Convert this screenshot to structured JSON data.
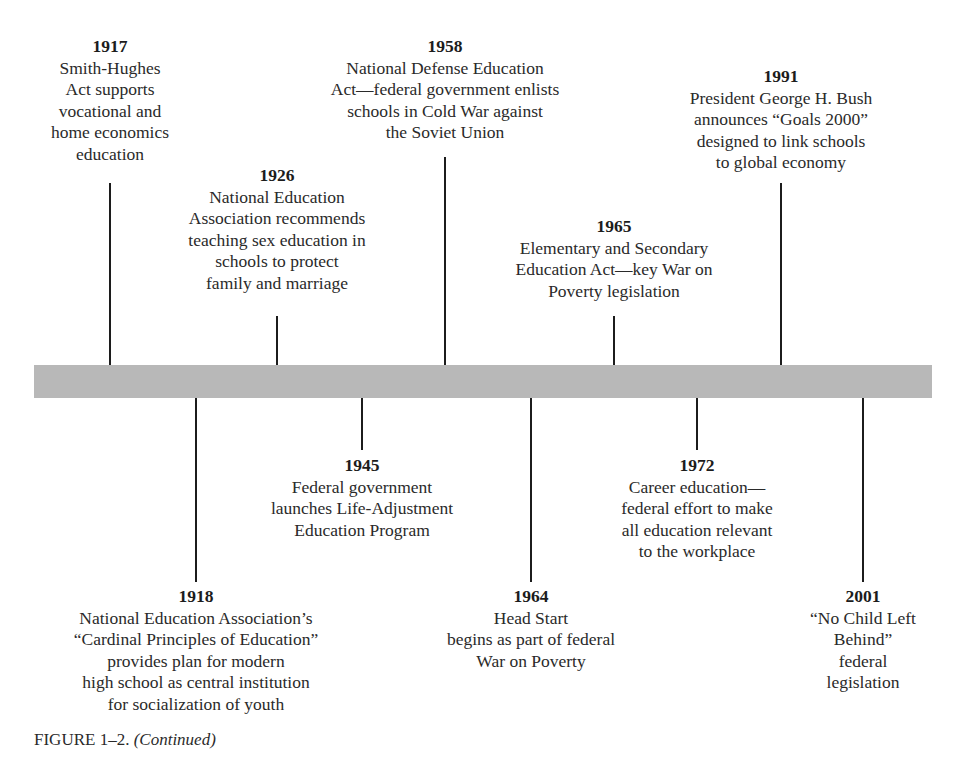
{
  "timeline": {
    "above": [
      {
        "year": "1917",
        "lines": [
          "Smith-Hughes",
          "Act supports",
          "vocational and",
          "home economics",
          "education"
        ]
      },
      {
        "year": "1926",
        "lines": [
          "National Education",
          "Association recommends",
          "teaching sex education in",
          "schools to protect",
          "family and marriage"
        ]
      },
      {
        "year": "1958",
        "lines": [
          "National Defense Education",
          "Act—federal government enlists",
          "schools in Cold War against",
          "the Soviet Union"
        ]
      },
      {
        "year": "1965",
        "lines": [
          "Elementary and Secondary",
          "Education Act—key War on",
          "Poverty legislation"
        ]
      },
      {
        "year": "1991",
        "lines": [
          "President George H. Bush",
          "announces “Goals 2000”",
          "designed to link schools",
          "to global economy"
        ]
      }
    ],
    "below": [
      {
        "year": "1918",
        "lines": [
          "National Education Association’s",
          "“Cardinal Principles of Education”",
          "provides plan for modern",
          "high school as central institution",
          "for socialization of youth"
        ]
      },
      {
        "year": "1945",
        "lines": [
          "Federal government",
          "launches Life-Adjustment",
          "Education Program"
        ]
      },
      {
        "year": "1964",
        "lines": [
          "Head Start",
          "begins as part of federal",
          "War on Poverty"
        ]
      },
      {
        "year": "1972",
        "lines": [
          "Career education—",
          "federal effort to make",
          "all education relevant",
          "to the workplace"
        ]
      },
      {
        "year": "2001",
        "lines": [
          "“No Child Left",
          "Behind”",
          "federal",
          "legislation"
        ]
      }
    ]
  },
  "caption": {
    "label": "FIGURE 1–2.",
    "note": "(Continued)"
  },
  "colors": {
    "bar": "#b8b8b8",
    "stem": "#1c1c1c",
    "text": "#2a2a2a"
  }
}
